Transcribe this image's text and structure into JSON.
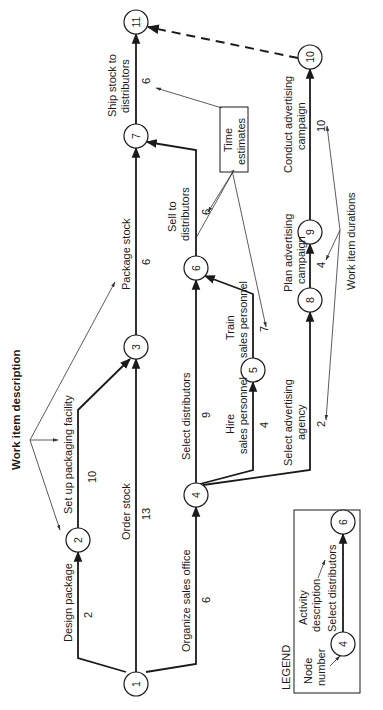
{
  "diagram": {
    "orientation": "rotated 90° counter-clockwise",
    "annotations": {
      "work_item_description": "Work item description",
      "time_estimates": [
        "Time",
        "estimates"
      ],
      "work_item_durations": "Work item durations"
    },
    "nodes": [
      {
        "id": "1",
        "label": "1"
      },
      {
        "id": "2",
        "label": "2"
      },
      {
        "id": "3",
        "label": "3"
      },
      {
        "id": "4",
        "label": "4"
      },
      {
        "id": "5",
        "label": "5"
      },
      {
        "id": "6",
        "label": "6"
      },
      {
        "id": "7",
        "label": "7"
      },
      {
        "id": "8",
        "label": "8"
      },
      {
        "id": "9",
        "label": "9"
      },
      {
        "id": "10",
        "label": "10"
      },
      {
        "id": "11",
        "label": "11"
      }
    ],
    "activities": [
      {
        "from": "1",
        "to": "2",
        "description": "Design package",
        "duration": "2"
      },
      {
        "from": "2",
        "to": "3",
        "description": "Set up packaging facility",
        "duration": "10"
      },
      {
        "from": "1",
        "to": "3",
        "description": "Order stock",
        "duration": "13"
      },
      {
        "from": "1",
        "to": "4",
        "description": "Organize sales office",
        "duration": "6"
      },
      {
        "from": "3",
        "to": "7",
        "description": "Package stock",
        "duration": "6"
      },
      {
        "from": "4",
        "to": "6",
        "description": "Select distributors",
        "duration": "9"
      },
      {
        "from": "4",
        "to": "5",
        "description_lines": [
          "Hire",
          "sales personnel"
        ],
        "duration": "4"
      },
      {
        "from": "5",
        "to": "6",
        "description_lines": [
          "Train",
          "sales personnel"
        ],
        "duration": "7"
      },
      {
        "from": "6",
        "to": "7",
        "description_lines": [
          "Sell to",
          "distributors"
        ],
        "duration": "6"
      },
      {
        "from": "7",
        "to": "11",
        "description_lines": [
          "Ship stock to",
          "distributors"
        ],
        "duration": "6"
      },
      {
        "from": "4",
        "to": "8",
        "description_lines": [
          "Select advertising",
          "agency"
        ],
        "duration": "2"
      },
      {
        "from": "8",
        "to": "9",
        "description_lines": [
          "Plan advertising",
          "campaign"
        ],
        "duration": "4"
      },
      {
        "from": "9",
        "to": "10",
        "description_lines": [
          "Conduct advertising",
          "campaign"
        ],
        "duration": "10"
      },
      {
        "from": "10",
        "to": "11",
        "description": "",
        "duration": "",
        "style": "dashed"
      }
    ],
    "legend": {
      "title": "LEGEND",
      "node_number_label": [
        "Node",
        "number"
      ],
      "activity_description_label": [
        "Activity",
        "description"
      ],
      "example_from": "4",
      "example_to": "6",
      "example_activity": "Select distributors"
    }
  }
}
